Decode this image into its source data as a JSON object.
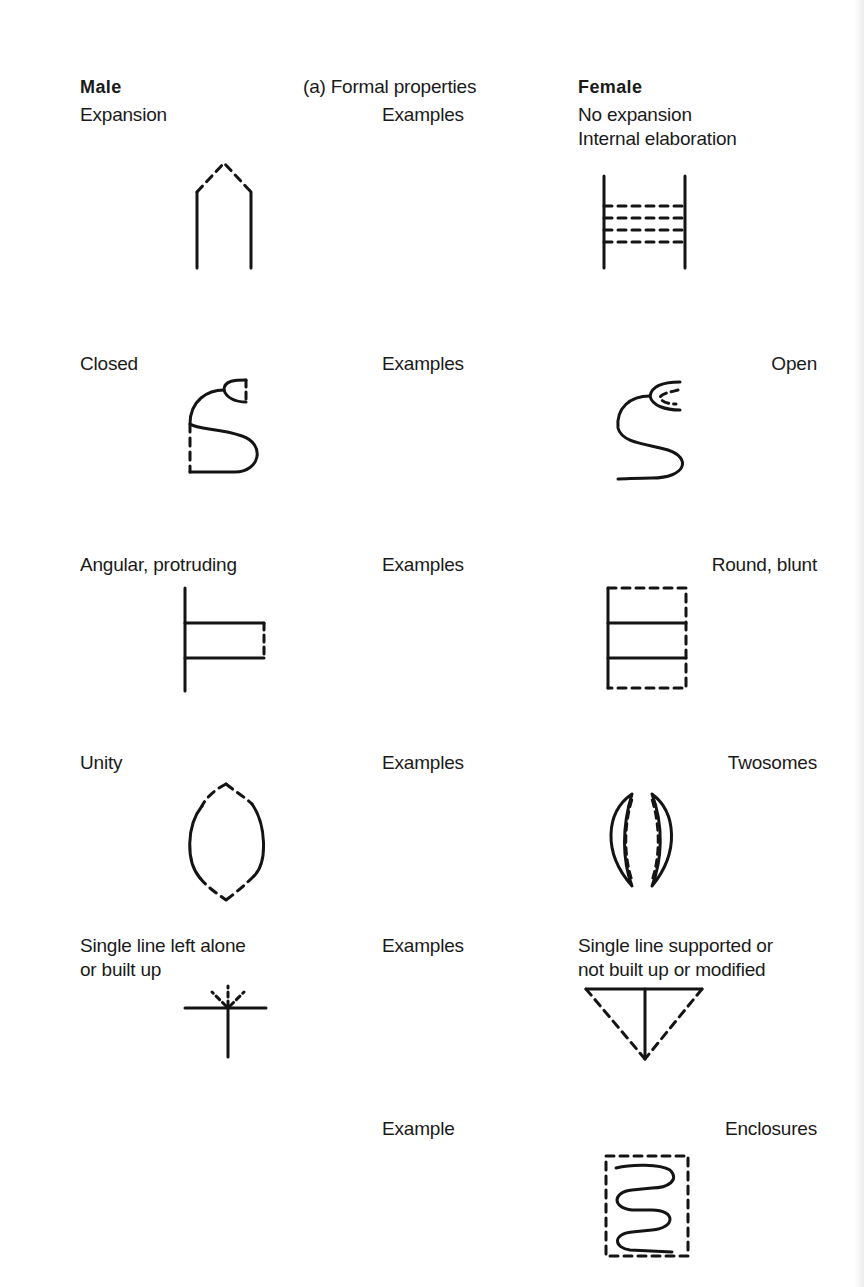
{
  "header": {
    "left_title": "Male",
    "center_title": "(a) Formal properties",
    "right_title": "Female"
  },
  "rows": [
    {
      "male_label": "Expansion",
      "examples_label": "Examples",
      "female_label_lines": [
        "No expansion",
        "Internal elaboration"
      ],
      "male_figure": "pointed-arch-dashed-roof-icon",
      "female_figure": "ladder-dashed-rungs-icon"
    },
    {
      "male_label": "Closed",
      "examples_label": "Examples",
      "female_label": "Open",
      "male_figure": "closed-s-curve-icon",
      "female_figure": "open-s-curve-icon"
    },
    {
      "male_label": "Angular, protruding",
      "examples_label": "Examples",
      "female_label": "Round, blunt",
      "male_figure": "protruding-rectangle-icon",
      "female_figure": "enclosed-rectangle-icon"
    },
    {
      "male_label": "Unity",
      "examples_label": "Examples",
      "female_label": "Twosomes",
      "male_figure": "single-oval-icon",
      "female_figure": "paired-crescents-icon"
    },
    {
      "male_label_lines": [
        "Single line left alone",
        "or built up"
      ],
      "examples_label": "Examples",
      "female_label_lines": [
        "Single line supported or",
        "not built up or modified"
      ],
      "male_figure": "cross-with-rays-icon",
      "female_figure": "supported-triangle-icon"
    },
    {
      "examples_label": "Example",
      "female_label": "Enclosures",
      "female_figure": "enclosed-serpentine-icon"
    }
  ]
}
